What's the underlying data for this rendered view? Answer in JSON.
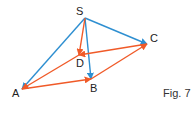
{
  "figure": {
    "caption": "Fig. 7",
    "colors": {
      "blue": "#2e8fd1",
      "red": "#f05a28",
      "text": "#222222"
    },
    "points": {
      "S": {
        "label": "S",
        "x": 85,
        "y": 18
      },
      "C": {
        "label": "C",
        "x": 147,
        "y": 44
      },
      "D": {
        "label": "D",
        "x": 79,
        "y": 55
      },
      "A": {
        "label": "A",
        "x": 22,
        "y": 89
      },
      "B": {
        "label": "B",
        "x": 91,
        "y": 79
      }
    },
    "vectors": [
      {
        "from": "S",
        "to": "A",
        "color": "blue"
      },
      {
        "from": "S",
        "to": "B",
        "color": "blue"
      },
      {
        "from": "S",
        "to": "C",
        "color": "blue"
      },
      {
        "from": "S",
        "to": "D",
        "color": "red"
      },
      {
        "from": "A",
        "to": "B",
        "color": "red"
      },
      {
        "from": "B",
        "to": "C",
        "color": "red"
      },
      {
        "from": "C",
        "to": "D",
        "color": "red"
      },
      {
        "from": "D",
        "to": "A",
        "color": "red"
      }
    ]
  }
}
